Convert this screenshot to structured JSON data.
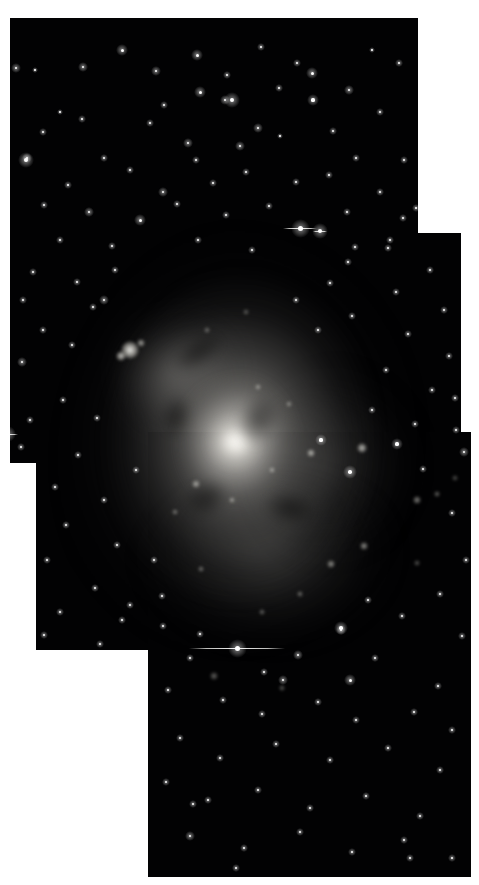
{
  "image": {
    "kind": "astronomical-mosaic",
    "subject": "face-on spiral galaxy",
    "color_mode": "grayscale",
    "background_color": "#ffffff",
    "sky_color": "#020203",
    "width": 479,
    "height": 885,
    "alt_text": "Grayscale three-panel astronomical mosaic of a face-on spiral galaxy with a bright nucleus, mottled spiral arms, scattered foreground stars and visible rectangular tile seams on a white background."
  },
  "tiles": [
    {
      "id": "tile-top",
      "label": "top panel",
      "x": 10,
      "y": 18,
      "w": 408,
      "h": 445
    },
    {
      "id": "tile-middle",
      "label": "middle panel",
      "x": 36,
      "y": 233,
      "w": 425,
      "h": 417
    },
    {
      "id": "tile-bottom",
      "label": "bottom panel",
      "x": 148,
      "y": 432,
      "w": 323,
      "h": 445
    }
  ],
  "galaxy": {
    "nucleus_x": 236,
    "nucleus_y": 443,
    "core_brightness": "saturated-white",
    "disk_tone": "#9a9893"
  },
  "features": {
    "bright_knot_label": "bright HII region knot",
    "bleed_star_label": "saturated star with CCD bleed trail"
  },
  "bleed_stars": [
    {
      "x": 300,
      "y": 228,
      "len": 34,
      "size": 5
    },
    {
      "x": 320,
      "y": 231,
      "len": 14,
      "size": 4
    },
    {
      "x": 237,
      "y": 648,
      "len": 96,
      "size": 5
    },
    {
      "x": 8,
      "y": 434,
      "len": 20,
      "size": 4
    }
  ],
  "bright_knots": [
    {
      "x": 130,
      "y": 350,
      "r": 9,
      "o": 0.95
    },
    {
      "x": 121,
      "y": 356,
      "r": 5,
      "o": 0.8
    },
    {
      "x": 141,
      "y": 343,
      "r": 4,
      "o": 0.65
    },
    {
      "x": 196,
      "y": 484,
      "r": 4,
      "o": 0.6
    },
    {
      "x": 232,
      "y": 500,
      "r": 3,
      "o": 0.55
    },
    {
      "x": 272,
      "y": 470,
      "r": 3,
      "o": 0.55
    },
    {
      "x": 311,
      "y": 453,
      "r": 4,
      "o": 0.7
    },
    {
      "x": 362,
      "y": 448,
      "r": 5,
      "o": 0.75
    },
    {
      "x": 364,
      "y": 546,
      "r": 4,
      "o": 0.6
    },
    {
      "x": 331,
      "y": 564,
      "r": 4,
      "o": 0.58
    },
    {
      "x": 417,
      "y": 500,
      "r": 4,
      "o": 0.55
    },
    {
      "x": 437,
      "y": 494,
      "r": 3,
      "o": 0.45
    },
    {
      "x": 300,
      "y": 594,
      "r": 3,
      "o": 0.45
    },
    {
      "x": 262,
      "y": 612,
      "r": 3,
      "o": 0.42
    },
    {
      "x": 201,
      "y": 569,
      "r": 3,
      "o": 0.45
    },
    {
      "x": 175,
      "y": 512,
      "r": 3,
      "o": 0.45
    },
    {
      "x": 258,
      "y": 387,
      "r": 3,
      "o": 0.5
    },
    {
      "x": 289,
      "y": 404,
      "r": 3,
      "o": 0.45
    },
    {
      "x": 207,
      "y": 330,
      "r": 3,
      "o": 0.4
    },
    {
      "x": 246,
      "y": 312,
      "r": 3,
      "o": 0.36
    },
    {
      "x": 282,
      "y": 688,
      "r": 3,
      "o": 0.4
    },
    {
      "x": 214,
      "y": 676,
      "r": 4,
      "o": 0.42
    },
    {
      "x": 417,
      "y": 563,
      "r": 3,
      "o": 0.38
    },
    {
      "x": 455,
      "y": 478,
      "r": 3,
      "o": 0.35
    }
  ],
  "stars": [
    {
      "x": 16,
      "y": 68,
      "r": 1.3
    },
    {
      "x": 35,
      "y": 70,
      "r": 0.9
    },
    {
      "x": 83,
      "y": 67,
      "r": 1.4
    },
    {
      "x": 122,
      "y": 50,
      "r": 1.5
    },
    {
      "x": 156,
      "y": 71,
      "r": 1.3
    },
    {
      "x": 197,
      "y": 55,
      "r": 1.5
    },
    {
      "x": 227,
      "y": 75,
      "r": 1.0
    },
    {
      "x": 261,
      "y": 47,
      "r": 1.1
    },
    {
      "x": 297,
      "y": 63,
      "r": 1.0
    },
    {
      "x": 312,
      "y": 73,
      "r": 1.5
    },
    {
      "x": 349,
      "y": 90,
      "r": 1.2
    },
    {
      "x": 372,
      "y": 50,
      "r": 0.9
    },
    {
      "x": 399,
      "y": 63,
      "r": 1.0
    },
    {
      "x": 200,
      "y": 92,
      "r": 1.5
    },
    {
      "x": 225,
      "y": 100,
      "r": 1.4
    },
    {
      "x": 279,
      "y": 88,
      "r": 1.0
    },
    {
      "x": 164,
      "y": 105,
      "r": 1.0
    },
    {
      "x": 60,
      "y": 112,
      "r": 0.9
    },
    {
      "x": 3,
      "y": 100,
      "r": 1.6
    },
    {
      "x": 82,
      "y": 119,
      "r": 1.1
    },
    {
      "x": 232,
      "y": 100,
      "r": 2.0
    },
    {
      "x": 313,
      "y": 100,
      "r": 1.6
    },
    {
      "x": 150,
      "y": 123,
      "r": 1.1
    },
    {
      "x": 188,
      "y": 143,
      "r": 1.3
    },
    {
      "x": 258,
      "y": 128,
      "r": 1.4
    },
    {
      "x": 280,
      "y": 136,
      "r": 0.9
    },
    {
      "x": 240,
      "y": 146,
      "r": 1.3
    },
    {
      "x": 380,
      "y": 112,
      "r": 1.1
    },
    {
      "x": 333,
      "y": 131,
      "r": 1.0
    },
    {
      "x": 43,
      "y": 132,
      "r": 1.0
    },
    {
      "x": 27,
      "y": 158,
      "r": 1.4
    },
    {
      "x": 104,
      "y": 158,
      "r": 1.1
    },
    {
      "x": 130,
      "y": 170,
      "r": 1.0
    },
    {
      "x": 196,
      "y": 160,
      "r": 1.0
    },
    {
      "x": 356,
      "y": 158,
      "r": 1.1
    },
    {
      "x": 404,
      "y": 160,
      "r": 1.0
    },
    {
      "x": 68,
      "y": 185,
      "r": 1.0
    },
    {
      "x": 163,
      "y": 192,
      "r": 1.2
    },
    {
      "x": 213,
      "y": 183,
      "r": 1.1
    },
    {
      "x": 246,
      "y": 172,
      "r": 1.0
    },
    {
      "x": 296,
      "y": 182,
      "r": 1.1
    },
    {
      "x": 329,
      "y": 175,
      "r": 1.0
    },
    {
      "x": 380,
      "y": 192,
      "r": 1.0
    },
    {
      "x": 44,
      "y": 205,
      "r": 1.1
    },
    {
      "x": 89,
      "y": 212,
      "r": 1.2
    },
    {
      "x": 177,
      "y": 204,
      "r": 1.0
    },
    {
      "x": 226,
      "y": 215,
      "r": 1.0
    },
    {
      "x": 269,
      "y": 206,
      "r": 1.0
    },
    {
      "x": 347,
      "y": 212,
      "r": 1.0
    },
    {
      "x": 403,
      "y": 218,
      "r": 1.0
    },
    {
      "x": 26,
      "y": 160,
      "r": 2.0
    },
    {
      "x": 140,
      "y": 220,
      "r": 1.5
    },
    {
      "x": 60,
      "y": 240,
      "r": 1.0
    },
    {
      "x": 112,
      "y": 246,
      "r": 1.1
    },
    {
      "x": 198,
      "y": 240,
      "r": 1.0
    },
    {
      "x": 252,
      "y": 250,
      "r": 1.0
    },
    {
      "x": 355,
      "y": 247,
      "r": 1.0
    },
    {
      "x": 390,
      "y": 240,
      "r": 1.0
    },
    {
      "x": 33,
      "y": 272,
      "r": 1.0
    },
    {
      "x": 77,
      "y": 282,
      "r": 1.1
    },
    {
      "x": 23,
      "y": 300,
      "r": 1.0
    },
    {
      "x": 93,
      "y": 307,
      "r": 1.1
    },
    {
      "x": 43,
      "y": 330,
      "r": 1.0
    },
    {
      "x": 72,
      "y": 345,
      "r": 1.0
    },
    {
      "x": 22,
      "y": 362,
      "r": 1.2
    },
    {
      "x": 104,
      "y": 300,
      "r": 1.3
    },
    {
      "x": 115,
      "y": 270,
      "r": 1.0
    },
    {
      "x": 63,
      "y": 400,
      "r": 1.0
    },
    {
      "x": 30,
      "y": 420,
      "r": 1.0
    },
    {
      "x": 97,
      "y": 418,
      "r": 1.1
    },
    {
      "x": 21,
      "y": 447,
      "r": 1.0
    },
    {
      "x": 78,
      "y": 455,
      "r": 1.0
    },
    {
      "x": 55,
      "y": 487,
      "r": 1.0
    },
    {
      "x": 104,
      "y": 500,
      "r": 1.0
    },
    {
      "x": 66,
      "y": 525,
      "r": 1.1
    },
    {
      "x": 117,
      "y": 545,
      "r": 1.0
    },
    {
      "x": 47,
      "y": 560,
      "r": 1.0
    },
    {
      "x": 95,
      "y": 588,
      "r": 1.1
    },
    {
      "x": 60,
      "y": 612,
      "r": 1.0
    },
    {
      "x": 122,
      "y": 620,
      "r": 1.0
    },
    {
      "x": 44,
      "y": 635,
      "r": 1.0
    },
    {
      "x": 100,
      "y": 644,
      "r": 1.0
    },
    {
      "x": 136,
      "y": 470,
      "r": 1.0
    },
    {
      "x": 130,
      "y": 605,
      "r": 1.0
    },
    {
      "x": 348,
      "y": 262,
      "r": 1.0
    },
    {
      "x": 430,
      "y": 270,
      "r": 1.0
    },
    {
      "x": 396,
      "y": 292,
      "r": 1.1
    },
    {
      "x": 444,
      "y": 310,
      "r": 1.0
    },
    {
      "x": 408,
      "y": 334,
      "r": 1.0
    },
    {
      "x": 449,
      "y": 356,
      "r": 1.0
    },
    {
      "x": 386,
      "y": 370,
      "r": 1.0
    },
    {
      "x": 432,
      "y": 390,
      "r": 1.1
    },
    {
      "x": 372,
      "y": 410,
      "r": 1.0
    },
    {
      "x": 415,
      "y": 424,
      "r": 1.0
    },
    {
      "x": 456,
      "y": 430,
      "r": 1.0
    },
    {
      "x": 455,
      "y": 398,
      "r": 1.0
    },
    {
      "x": 330,
      "y": 283,
      "r": 1.0
    },
    {
      "x": 296,
      "y": 300,
      "r": 1.0
    },
    {
      "x": 318,
      "y": 330,
      "r": 1.0
    },
    {
      "x": 352,
      "y": 316,
      "r": 1.0
    },
    {
      "x": 388,
      "y": 248,
      "r": 1.0
    },
    {
      "x": 416,
      "y": 208,
      "r": 1.0
    },
    {
      "x": 397,
      "y": 444,
      "r": 1.6
    },
    {
      "x": 464,
      "y": 452,
      "r": 1.2
    },
    {
      "x": 423,
      "y": 469,
      "r": 1.0
    },
    {
      "x": 452,
      "y": 513,
      "r": 1.0
    },
    {
      "x": 466,
      "y": 560,
      "r": 1.0
    },
    {
      "x": 440,
      "y": 594,
      "r": 1.1
    },
    {
      "x": 402,
      "y": 616,
      "r": 1.0
    },
    {
      "x": 462,
      "y": 636,
      "r": 1.0
    },
    {
      "x": 368,
      "y": 600,
      "r": 1.0
    },
    {
      "x": 341,
      "y": 630,
      "r": 1.2
    },
    {
      "x": 375,
      "y": 658,
      "r": 1.0
    },
    {
      "x": 298,
      "y": 655,
      "r": 1.3
    },
    {
      "x": 264,
      "y": 672,
      "r": 1.0
    },
    {
      "x": 190,
      "y": 658,
      "r": 1.0
    },
    {
      "x": 168,
      "y": 690,
      "r": 1.0
    },
    {
      "x": 223,
      "y": 700,
      "r": 1.0
    },
    {
      "x": 262,
      "y": 714,
      "r": 1.0
    },
    {
      "x": 318,
      "y": 702,
      "r": 1.0
    },
    {
      "x": 356,
      "y": 720,
      "r": 1.1
    },
    {
      "x": 414,
      "y": 712,
      "r": 1.0
    },
    {
      "x": 452,
      "y": 730,
      "r": 1.0
    },
    {
      "x": 180,
      "y": 738,
      "r": 1.1
    },
    {
      "x": 220,
      "y": 758,
      "r": 1.0
    },
    {
      "x": 276,
      "y": 744,
      "r": 1.0
    },
    {
      "x": 330,
      "y": 760,
      "r": 1.0
    },
    {
      "x": 388,
      "y": 748,
      "r": 1.0
    },
    {
      "x": 440,
      "y": 770,
      "r": 1.0
    },
    {
      "x": 166,
      "y": 782,
      "r": 1.0
    },
    {
      "x": 208,
      "y": 800,
      "r": 1.0
    },
    {
      "x": 258,
      "y": 790,
      "r": 1.0
    },
    {
      "x": 310,
      "y": 808,
      "r": 1.0
    },
    {
      "x": 366,
      "y": 796,
      "r": 1.0
    },
    {
      "x": 420,
      "y": 816,
      "r": 1.0
    },
    {
      "x": 190,
      "y": 836,
      "r": 1.4
    },
    {
      "x": 244,
      "y": 848,
      "r": 1.0
    },
    {
      "x": 300,
      "y": 832,
      "r": 1.0
    },
    {
      "x": 352,
      "y": 852,
      "r": 1.1
    },
    {
      "x": 404,
      "y": 840,
      "r": 1.0
    },
    {
      "x": 452,
      "y": 858,
      "r": 1.0
    },
    {
      "x": 236,
      "y": 868,
      "r": 1.0
    },
    {
      "x": 350,
      "y": 680,
      "r": 1.5
    },
    {
      "x": 341,
      "y": 628,
      "r": 1.8
    },
    {
      "x": 163,
      "y": 626,
      "r": 1.0
    },
    {
      "x": 200,
      "y": 634,
      "r": 1.0
    },
    {
      "x": 283,
      "y": 680,
      "r": 1.4
    },
    {
      "x": 193,
      "y": 804,
      "r": 1.0
    },
    {
      "x": 410,
      "y": 858,
      "r": 1.0
    },
    {
      "x": 438,
      "y": 686,
      "r": 1.0
    },
    {
      "x": 154,
      "y": 560,
      "r": 1.0
    },
    {
      "x": 162,
      "y": 596,
      "r": 1.0
    },
    {
      "x": 350,
      "y": 472,
      "r": 1.8
    },
    {
      "x": 321,
      "y": 440,
      "r": 1.6
    }
  ],
  "dust_lanes": [
    {
      "x": 258,
      "y": 420,
      "w": 46,
      "h": 62,
      "rot": 28
    },
    {
      "x": 206,
      "y": 498,
      "w": 54,
      "h": 40,
      "rot": -20
    },
    {
      "x": 176,
      "y": 416,
      "w": 34,
      "h": 50,
      "rot": 14
    },
    {
      "x": 290,
      "y": 508,
      "w": 60,
      "h": 36,
      "rot": 10
    },
    {
      "x": 198,
      "y": 352,
      "w": 70,
      "h": 30,
      "rot": -34
    }
  ]
}
